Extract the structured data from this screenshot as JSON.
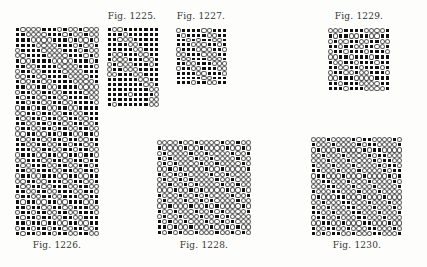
{
  "figures": [
    {
      "id": "fig-1225",
      "caption": "Fig. 1225.",
      "caption_pos": {
        "x": 132,
        "y": 11
      },
      "grid_pos": {
        "x": 107,
        "y": 27,
        "w": 52,
        "h": 80
      },
      "cols": 10,
      "rows_data": [
        "1001111111",
        "1110111111",
        "1100011111",
        "1111001111",
        "1111100111",
        "1001110011",
        "1000111001",
        "0100011101",
        "0110001111",
        "0011100111",
        "1111110011",
        "1111111001",
        "1111111100",
        "1111011110",
        "1111111100",
        "1011111100"
      ]
    },
    {
      "id": "fig-1227",
      "caption": "Fig. 1227.",
      "caption_pos": {
        "x": 201,
        "y": 11
      },
      "grid_pos": {
        "x": 176,
        "y": 28,
        "w": 51,
        "h": 57
      },
      "cols": 10,
      "rows_data": [
        "0111100111",
        "1011110011",
        "1101011001",
        "1110001101",
        "0111000110",
        "0011100011",
        "1001110001",
        "1100111000",
        "0110011100",
        "1111001110",
        "1111100111",
        "1110110011"
      ]
    },
    {
      "id": "fig-1229",
      "caption": "Fig. 1229.",
      "caption_pos": {
        "x": 359,
        "y": 11
      },
      "grid_pos": {
        "x": 328,
        "y": 28,
        "w": 62,
        "h": 63
      },
      "cols": 12,
      "rows_data": [
        "000111100001",
        "101100110011",
        "010011001100",
        "110110011001",
        "011011101110",
        "001101110111",
        "100110111011",
        "110011011101",
        "011001001110",
        "001110000111",
        "110111000011",
        "111011100001"
      ]
    },
    {
      "id": "fig-1226",
      "caption": "Fig. 1226.",
      "caption_pos": {
        "x": 57,
        "y": 240
      },
      "grid_pos": {
        "x": 15,
        "y": 27,
        "w": 84,
        "h": 209
      },
      "cols": 16,
      "rows_data": [
        "1000011101001000",
        "1100001110100100",
        "1110000111010010",
        "1111000011101001",
        "0111100001110100",
        "0011110000111010",
        "1001111000011101",
        "1100111100001110",
        "0110011110000111",
        "0011001111000011",
        "1001100111100001",
        "1100110011110000",
        "0110011001111000",
        "1011001100111100",
        "1101100110011110",
        "0110110011001111",
        "0011011001100111",
        "1001101100110011",
        "1100110110011001",
        "0110011011001100",
        "0011001101100110",
        "1001100110110011",
        "1100110011011001",
        "1110011001101100",
        "0111001100110110",
        "0011100110011011",
        "1001110011001101",
        "1100111001100110",
        "0110011100110011",
        "0011001110011001",
        "1001100111001100",
        "1100110011100110",
        "0110011001110011",
        "1011001100111001",
        "1101100110011100",
        "0110110011001110",
        "1011011001100111",
        "1101101100110011",
        "0110110110011001",
        "1011011011001100"
      ]
    },
    {
      "id": "fig-1228",
      "caption": "Fig. 1228.",
      "caption_pos": {
        "x": 204,
        "y": 240
      },
      "grid_pos": {
        "x": 157,
        "y": 140,
        "w": 94,
        "h": 95
      },
      "cols": 18,
      "rows_data": [
        "000010010000100100",
        "100001001000010010",
        "010000100100001001",
        "101000010010000100",
        "010100001001000010",
        "001010000100100001",
        "100101000010010000",
        "010010100001001000",
        "001001010000100100",
        "000100101000010010",
        "100010010100001001",
        "010001001010000100",
        "001000100101000010",
        "100100010010100001",
        "010010001001010000",
        "101001000100101000",
        "110100100010010100",
        "101010010001001010"
      ]
    },
    {
      "id": "fig-1230",
      "caption": "Fig. 1230.",
      "caption_pos": {
        "x": 357,
        "y": 240
      },
      "grid_pos": {
        "x": 311,
        "y": 137,
        "w": 91,
        "h": 99
      },
      "cols": 18,
      "rows_data": [
        "000100001011000010",
        "100010000101100001",
        "010001000010110000",
        "001000100001011000",
        "000100010000101100",
        "100010001000010110",
        "110001000100001011",
        "011000100010000101",
        "001100010001000010",
        "000110001000100001",
        "100011000100010000",
        "010001100010001000",
        "001000110001000100",
        "100100011000100010",
        "110010001100010001",
        "011001000110001000",
        "001100100011000100",
        "100110010001100010",
        "101011001000110001"
      ]
    }
  ],
  "colors": {
    "filled": "#111111",
    "empty_ring": "#555555",
    "background": "#fdfdfb",
    "caption": "#333333"
  }
}
